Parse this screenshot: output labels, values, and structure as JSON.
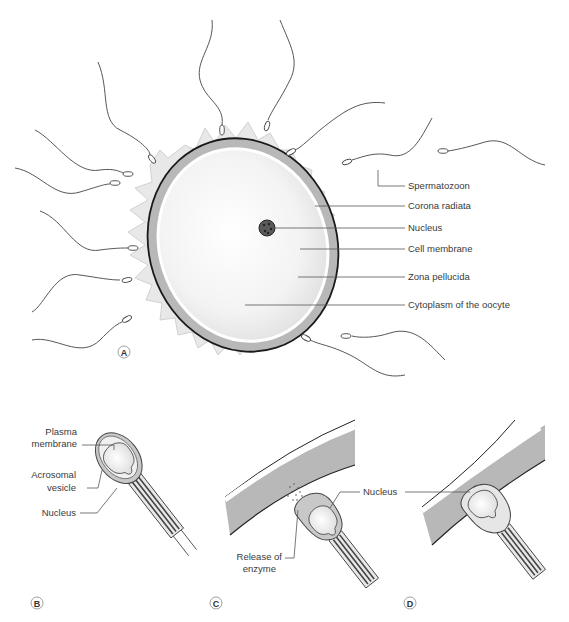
{
  "figure": {
    "panels": [
      {
        "id": "A",
        "letter": "A",
        "labels": {
          "spermatozoon": "Spermatozoon",
          "corona_radiata": "Corona radiata",
          "nucleus": "Nucleus",
          "cell_membrane": "Cell membrane",
          "zona_pellucida": "Zona pellucida",
          "cytoplasm": "Cytoplasm of the oocyte"
        }
      },
      {
        "id": "B",
        "letter": "B",
        "labels": {
          "plasma_membrane_1": "Plasma",
          "plasma_membrane_2": "membrane",
          "acrosomal_vesicle_1": "Acrosomal",
          "acrosomal_vesicle_2": "vesicle",
          "nucleus": "Nucleus"
        }
      },
      {
        "id": "C",
        "letter": "C",
        "labels": {
          "nucleus": "Nucleus",
          "release_1": "Release of",
          "release_2": "enzyme"
        }
      },
      {
        "id": "D",
        "letter": "D",
        "labels": {}
      }
    ],
    "colors": {
      "corona": "#e6e6e6",
      "zona": "#b4b4b4",
      "cytoplasm": "#f2f2f2",
      "nucleus": "#555555",
      "outline": "#222222"
    }
  }
}
